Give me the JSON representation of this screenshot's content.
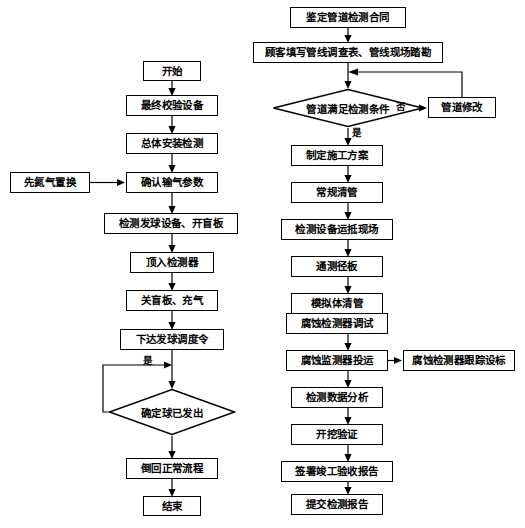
{
  "diagram": {
    "left_column": {
      "nodes": [
        {
          "id": "l1",
          "label": "开始",
          "type": "process",
          "x": 143,
          "y": 61,
          "w": 58,
          "h": 20
        },
        {
          "id": "l2",
          "label": "最终校验设备",
          "type": "process",
          "x": 126,
          "y": 95,
          "w": 92,
          "h": 21
        },
        {
          "id": "l3",
          "label": "总体安装检测",
          "type": "process",
          "x": 126,
          "y": 133,
          "w": 92,
          "h": 21
        },
        {
          "id": "l4",
          "label": "确认输气参数",
          "type": "process",
          "x": 126,
          "y": 172,
          "w": 92,
          "h": 21
        },
        {
          "id": "l5",
          "label": "检测发球设备、开盲板",
          "type": "process",
          "x": 104,
          "y": 213,
          "w": 134,
          "h": 21
        },
        {
          "id": "l6",
          "label": "顶入检测器",
          "type": "process",
          "x": 130,
          "y": 252,
          "w": 84,
          "h": 21
        },
        {
          "id": "l7",
          "label": "关盲板、充气",
          "type": "process",
          "x": 126,
          "y": 290,
          "w": 92,
          "h": 21
        },
        {
          "id": "l8",
          "label": "下达发球调度令",
          "type": "process",
          "x": 120,
          "y": 329,
          "w": 104,
          "h": 21
        },
        {
          "id": "l9",
          "label": "确定球已发出",
          "type": "decision",
          "x": 108,
          "y": 388,
          "w": 128,
          "h": 48
        },
        {
          "id": "l10",
          "label": "倒回正常流程",
          "type": "process",
          "x": 126,
          "y": 458,
          "w": 92,
          "h": 21
        },
        {
          "id": "l11",
          "label": "结束",
          "type": "process",
          "x": 143,
          "y": 496,
          "w": 58,
          "h": 20
        }
      ],
      "side_nodes": [
        {
          "id": "ls1",
          "label": "先氮气置换",
          "type": "process",
          "x": 10,
          "y": 172,
          "w": 80,
          "h": 21
        }
      ],
      "edge_labels": [
        {
          "id": "yes-loop",
          "text": "是",
          "x": 143,
          "y": 361
        }
      ]
    },
    "right_column": {
      "nodes": [
        {
          "id": "r1",
          "label": "鉴定管道检测合同",
          "type": "process",
          "x": 290,
          "y": 7,
          "w": 116,
          "h": 21
        },
        {
          "id": "r2",
          "label": "顾客填写管线调查表、管线现场踏勘",
          "type": "process",
          "x": 253,
          "y": 42,
          "w": 190,
          "h": 21
        },
        {
          "id": "r3",
          "label": "管道满足检测条件",
          "type": "decision",
          "x": 272,
          "y": 88,
          "w": 152,
          "h": 40
        },
        {
          "id": "r4",
          "label": "制定施工方案",
          "type": "process",
          "x": 291,
          "y": 145,
          "w": 92,
          "h": 21
        },
        {
          "id": "r5",
          "label": "常规清管",
          "type": "process",
          "x": 291,
          "y": 182,
          "w": 92,
          "h": 21
        },
        {
          "id": "r6",
          "label": "检测设备运抵现场",
          "type": "process",
          "x": 281,
          "y": 219,
          "w": 112,
          "h": 21
        },
        {
          "id": "r7",
          "label": "通测径板",
          "type": "process",
          "x": 291,
          "y": 256,
          "w": 92,
          "h": 21
        },
        {
          "id": "r8",
          "label": "模拟体清管",
          "type": "process",
          "x": 291,
          "y": 293,
          "w": 92,
          "h": 21
        },
        {
          "id": "r9",
          "label": "腐蚀检测器调试",
          "type": "process",
          "x": 286,
          "y": 313,
          "w": 102,
          "h": 21
        },
        {
          "id": "r10",
          "label": "腐蚀监测器投运",
          "type": "process",
          "x": 286,
          "y": 350,
          "w": 102,
          "h": 21
        },
        {
          "id": "r11",
          "label": "检测数据分析",
          "type": "process",
          "x": 291,
          "y": 387,
          "w": 92,
          "h": 21
        },
        {
          "id": "r12",
          "label": "开挖验证",
          "type": "process",
          "x": 291,
          "y": 424,
          "w": 92,
          "h": 21
        },
        {
          "id": "r13",
          "label": "签署竣工验收报告",
          "type": "process",
          "x": 281,
          "y": 461,
          "w": 112,
          "h": 21
        },
        {
          "id": "r14",
          "label": "提交检测报告",
          "type": "process",
          "x": 291,
          "y": 494,
          "w": 92,
          "h": 21
        }
      ],
      "side_nodes": [
        {
          "id": "rs1",
          "label": "管道修改",
          "type": "process",
          "x": 428,
          "y": 97,
          "w": 68,
          "h": 21
        },
        {
          "id": "rs2",
          "label": "腐蚀检测器跟踪设标",
          "type": "process",
          "x": 403,
          "y": 350,
          "w": 112,
          "h": 21
        }
      ],
      "edge_labels": [
        {
          "id": "no-branch",
          "text": "否",
          "x": 401,
          "y": 102
        },
        {
          "id": "yes-branch",
          "text": "是",
          "x": 352,
          "y": 131
        }
      ]
    },
    "colors": {
      "stroke": "#000000",
      "fill": "#ffffff",
      "text": "#000000"
    }
  }
}
